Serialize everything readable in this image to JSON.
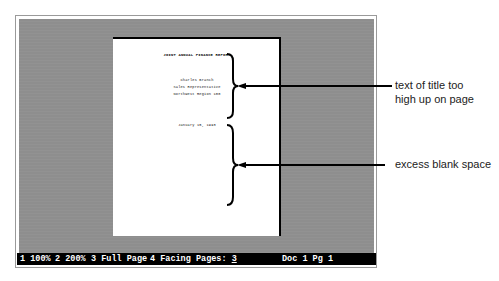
{
  "document": {
    "title": "JOINT ANNUAL FINANCE REPORT",
    "author_lines": [
      "Charles Branch",
      "Sales Representative",
      "Northwest Region 100"
    ],
    "date": "January 15, 1993"
  },
  "annotations": [
    {
      "lines": [
        "text of title too",
        "high up on page"
      ]
    },
    {
      "lines": [
        "excess blank space"
      ]
    }
  ],
  "status_bar": {
    "options": [
      {
        "key": "1",
        "label": "100%"
      },
      {
        "key": "2",
        "label": "200%"
      },
      {
        "key": "3",
        "label": "Full Page"
      },
      {
        "key": "4",
        "label": "Facing Pages:"
      }
    ],
    "current_selection": "3",
    "doc_label": "Doc 1 Pg 1"
  },
  "colors": {
    "screen_gray": "#8e8e8e",
    "status_bg": "#000000",
    "status_fg": "#ffffff",
    "page_bg": "#ffffff"
  }
}
